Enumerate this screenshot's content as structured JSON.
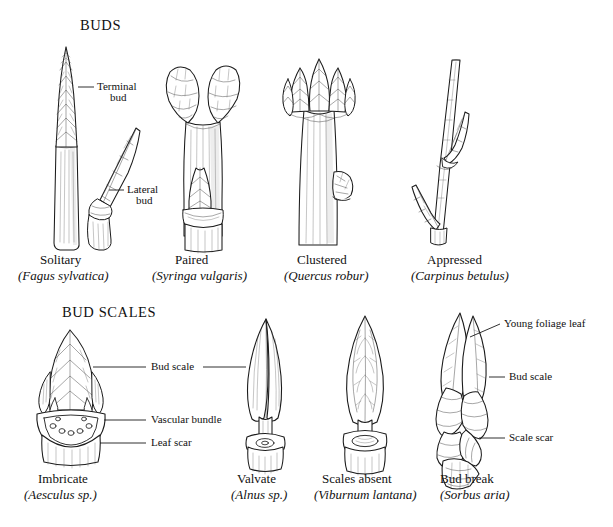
{
  "page": {
    "background_color": "#ffffff",
    "ink_color": "#1b1b1b",
    "width": 613,
    "height": 527
  },
  "sections": [
    {
      "id": "buds",
      "title": "BUDS",
      "annotations": [
        {
          "name": "terminal-bud",
          "line1": "Terminal",
          "line2": "bud"
        },
        {
          "name": "lateral-bud",
          "line1": "Lateral",
          "line2": "bud"
        }
      ],
      "specimens": [
        {
          "name": "solitary",
          "common": "Solitary",
          "latin": "(Fagus sylvatica)"
        },
        {
          "name": "paired",
          "common": "Paired",
          "latin": "(Syringa vulgaris)"
        },
        {
          "name": "clustered",
          "common": "Clustered",
          "latin": "(Quercus robur)"
        },
        {
          "name": "appressed",
          "common": "Appressed",
          "latin": "(Carpinus betulus)"
        }
      ]
    },
    {
      "id": "bud-scales",
      "title": "BUD SCALES",
      "annotations": [
        {
          "name": "bud-scale-left",
          "text": "Bud scale"
        },
        {
          "name": "vascular-bundle",
          "text": "Vascular bundle"
        },
        {
          "name": "leaf-scar",
          "text": "Leaf scar"
        },
        {
          "name": "young-foliage-leaf",
          "text": "Young foliage leaf"
        },
        {
          "name": "bud-scale-right",
          "text": "Bud scale"
        },
        {
          "name": "scale-scar",
          "text": "Scale scar"
        }
      ],
      "specimens": [
        {
          "name": "imbricate",
          "common": "Imbricate",
          "latin": "(Aesculus sp.)"
        },
        {
          "name": "valvate",
          "common": "Valvate",
          "latin": "(Alnus sp.)"
        },
        {
          "name": "scales-absent",
          "common": "Scales absent",
          "latin": "(Viburnum lantana)"
        },
        {
          "name": "bud-break",
          "common": "Bud break",
          "latin": "(Sorbus aria)"
        }
      ]
    }
  ]
}
